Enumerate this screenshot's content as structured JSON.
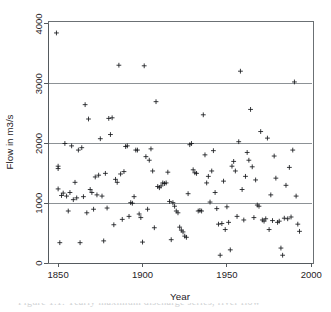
{
  "figure": {
    "alt_name": "flow-vs-year-scatter",
    "caption_fragment": "Figure 1.1: Yearly maximum discharge series, river flow"
  },
  "chart_data": {
    "type": "scatter",
    "title": "",
    "xlabel": "Year",
    "ylabel": "Flow in m3/s",
    "xlim": [
      1844,
      2001
    ],
    "ylim": [
      0,
      4050
    ],
    "xticks": [
      1850,
      1900,
      1950,
      2000
    ],
    "yticks": [
      0,
      1000,
      2000,
      3000,
      4000
    ],
    "xtick_labels": [
      "1850",
      "1900",
      "1950",
      "2000"
    ],
    "ytick_labels": [
      "0",
      "1000",
      "2000",
      "3000",
      "4000"
    ],
    "grid": false,
    "legend": "none",
    "marker": "plus",
    "marker_color": "#16191c",
    "reference_lines": {
      "orientation": "horizontal",
      "values": [
        1000,
        2000,
        3000
      ],
      "color": "#8d9296"
    },
    "series": [
      {
        "name": "Annual maximum flow",
        "points": [
          [
            1849,
            3850
          ],
          [
            1850,
            1620
          ],
          [
            1850,
            1580
          ],
          [
            1850,
            1240
          ],
          [
            1851,
            340
          ],
          [
            1852,
            1130
          ],
          [
            1853,
            1170
          ],
          [
            1854,
            2000
          ],
          [
            1855,
            1120
          ],
          [
            1856,
            870
          ],
          [
            1857,
            1180
          ],
          [
            1858,
            1960
          ],
          [
            1859,
            1060
          ],
          [
            1860,
            1350
          ],
          [
            1861,
            1090
          ],
          [
            1862,
            1890
          ],
          [
            1863,
            340
          ],
          [
            1864,
            1930
          ],
          [
            1865,
            1110
          ],
          [
            1866,
            2650
          ],
          [
            1867,
            840
          ],
          [
            1868,
            2410
          ],
          [
            1869,
            1230
          ],
          [
            1870,
            1180
          ],
          [
            1871,
            900
          ],
          [
            1872,
            1440
          ],
          [
            1873,
            1140
          ],
          [
            1874,
            1470
          ],
          [
            1875,
            2080
          ],
          [
            1876,
            1120
          ],
          [
            1877,
            370
          ],
          [
            1878,
            1500
          ],
          [
            1879,
            920
          ],
          [
            1880,
            2420
          ],
          [
            1881,
            2150
          ],
          [
            1882,
            2430
          ],
          [
            1883,
            640
          ],
          [
            1884,
            1400
          ],
          [
            1885,
            1350
          ],
          [
            1886,
            3310
          ],
          [
            1887,
            1490
          ],
          [
            1888,
            730
          ],
          [
            1889,
            1530
          ],
          [
            1890,
            1950
          ],
          [
            1891,
            1960
          ],
          [
            1892,
            780
          ],
          [
            1893,
            1010
          ],
          [
            1894,
            1000
          ],
          [
            1895,
            1110
          ],
          [
            1896,
            1890
          ],
          [
            1897,
            1890
          ],
          [
            1898,
            820
          ],
          [
            1899,
            760
          ],
          [
            1900,
            350
          ],
          [
            1901,
            3300
          ],
          [
            1902,
            1780
          ],
          [
            1903,
            900
          ],
          [
            1904,
            1720
          ],
          [
            1905,
            1910
          ],
          [
            1906,
            1540
          ],
          [
            1907,
            590
          ],
          [
            1908,
            2700
          ],
          [
            1909,
            1280
          ],
          [
            1910,
            1260
          ],
          [
            1911,
            1290
          ],
          [
            1912,
            1340
          ],
          [
            1913,
            1330
          ],
          [
            1914,
            1340
          ],
          [
            1915,
            1520
          ],
          [
            1916,
            1030
          ],
          [
            1917,
            390
          ],
          [
            1918,
            1010
          ],
          [
            1919,
            950
          ],
          [
            1920,
            870
          ],
          [
            1921,
            840
          ],
          [
            1922,
            600
          ],
          [
            1923,
            550
          ],
          [
            1924,
            520
          ],
          [
            1925,
            450
          ],
          [
            1926,
            430
          ],
          [
            1927,
            1160
          ],
          [
            1928,
            1980
          ],
          [
            1929,
            2000
          ],
          [
            1930,
            1560
          ],
          [
            1931,
            1510
          ],
          [
            1932,
            1500
          ],
          [
            1933,
            870
          ],
          [
            1934,
            880
          ],
          [
            1935,
            870
          ],
          [
            1936,
            2480
          ],
          [
            1937,
            1810
          ],
          [
            1938,
            1340
          ],
          [
            1939,
            1450
          ],
          [
            1940,
            1020
          ],
          [
            1941,
            1540
          ],
          [
            1942,
            1880
          ],
          [
            1943,
            1180
          ],
          [
            1944,
            910
          ],
          [
            1945,
            650
          ],
          [
            1946,
            130
          ],
          [
            1947,
            660
          ],
          [
            1948,
            1370
          ],
          [
            1949,
            560
          ],
          [
            1950,
            940
          ],
          [
            1951,
            680
          ],
          [
            1952,
            220
          ],
          [
            1953,
            1620
          ],
          [
            1954,
            1700
          ],
          [
            1955,
            1540
          ],
          [
            1956,
            780
          ],
          [
            1957,
            2030
          ],
          [
            1958,
            3210
          ],
          [
            1959,
            1230
          ],
          [
            1960,
            720
          ],
          [
            1961,
            1450
          ],
          [
            1962,
            1850
          ],
          [
            1963,
            1720
          ],
          [
            1964,
            2570
          ],
          [
            1965,
            1610
          ],
          [
            1966,
            760
          ],
          [
            1967,
            1390
          ],
          [
            1968,
            970
          ],
          [
            1969,
            950
          ],
          [
            1970,
            2200
          ],
          [
            1971,
            720
          ],
          [
            1972,
            700
          ],
          [
            1973,
            740
          ],
          [
            1974,
            2090
          ],
          [
            1975,
            560
          ],
          [
            1976,
            1140
          ],
          [
            1977,
            710
          ],
          [
            1978,
            1790
          ],
          [
            1979,
            1420
          ],
          [
            1980,
            680
          ],
          [
            1981,
            700
          ],
          [
            1982,
            250
          ],
          [
            1983,
            130
          ],
          [
            1984,
            750
          ],
          [
            1985,
            1300
          ],
          [
            1986,
            740
          ],
          [
            1987,
            1600
          ],
          [
            1988,
            770
          ],
          [
            1989,
            1890
          ],
          [
            1990,
            3030
          ],
          [
            1991,
            1120
          ],
          [
            1992,
            650
          ],
          [
            1993,
            530
          ]
        ]
      }
    ]
  }
}
